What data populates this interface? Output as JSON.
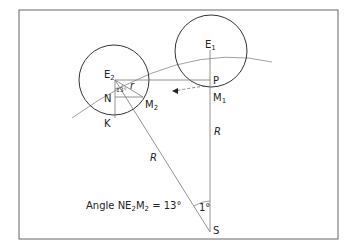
{
  "diagram": {
    "points": {
      "E1": "E",
      "E1_sub": "1",
      "E2": "E",
      "E2_sub": "2",
      "P": "P",
      "M1": "M",
      "M1_sub": "1",
      "M2": "M",
      "M2_sub": "2",
      "N": "N",
      "K": "K",
      "S": "S"
    },
    "labels": {
      "r": "r",
      "R_vertical": "R",
      "R_diagonal": "R",
      "angle_13": "13°",
      "angle_1": "1°"
    },
    "caption": {
      "prefix": "Angle NE",
      "sub1": "2",
      "mid": "M",
      "sub2": "2",
      "suffix": " = 13°"
    },
    "colors": {
      "frame": "#555555",
      "line": "#777777",
      "circle": "#333333"
    }
  }
}
